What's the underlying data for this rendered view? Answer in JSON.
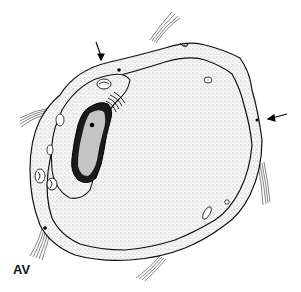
{
  "figure": {
    "label": "AV",
    "arrows": [
      {
        "name": "top-arrow",
        "x": 101,
        "y": 60
      },
      {
        "name": "right-arrow",
        "x": 270,
        "y": 118
      }
    ],
    "colors": {
      "ink": "#111111",
      "stipple": "#9a9a9a",
      "fill": "#f4f4f4",
      "nucleus_core": "#bdbdbd",
      "chromatin": "#1a1a1a"
    }
  }
}
